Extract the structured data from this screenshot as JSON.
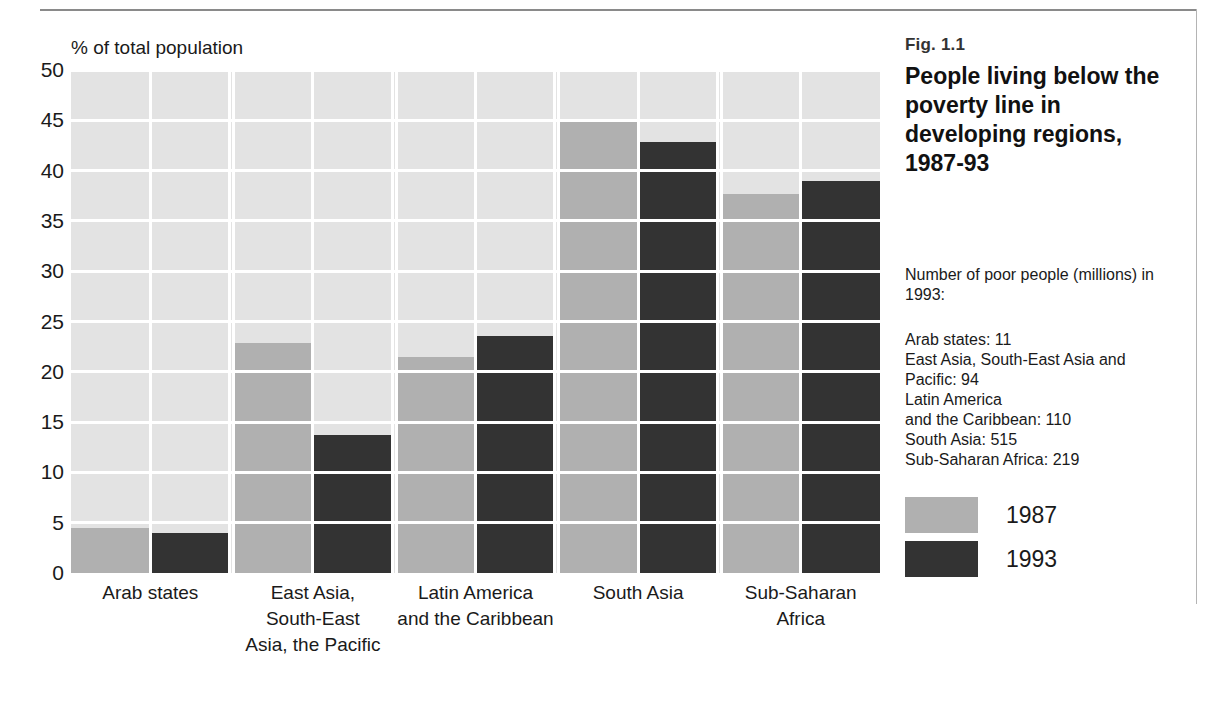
{
  "figure": {
    "number": "Fig. 1.1",
    "title": "People living below the poverty line in developing regions, 1987-93"
  },
  "side_notes": {
    "poor_heading": "Number of poor people (millions) in 1993:",
    "poor_values": "Arab states: 11\nEast Asia, South-East Asia and\nPacific: 94\nLatin America\nand the Caribbean: 110\nSouth Asia: 515\nSub-Saharan Africa: 219"
  },
  "colors": {
    "series_1987": "#b0b0b0",
    "series_1993": "#333333",
    "plot_background": "#e3e3e3",
    "gridline": "#ffffff",
    "rule": "#8a8a8a"
  },
  "chart_data": {
    "type": "bar",
    "title": "People living below the poverty line in developing regions, 1987-93",
    "subtitle": "Fig. 1.1",
    "xlabel": "",
    "ylabel": "% of total population",
    "ylim": [
      0,
      50
    ],
    "yticks": [
      0,
      5,
      10,
      15,
      20,
      25,
      30,
      35,
      40,
      45,
      50
    ],
    "ytick_labels": [
      "0",
      "5",
      "10",
      "15",
      "20",
      "25",
      "30",
      "35",
      "40",
      "45",
      "50"
    ],
    "grid": true,
    "legend_position": "right",
    "categories": [
      "Arab states",
      "East Asia,\nSouth-East\nAsia, the Pacific",
      "Latin America\nand the Caribbean",
      "South Asia",
      "Sub-Saharan\nAfrica"
    ],
    "series": [
      {
        "name": "1987",
        "color": "#b0b0b0",
        "values": [
          4.5,
          22.9,
          21.5,
          44.8,
          37.7
        ]
      },
      {
        "name": "1993",
        "color": "#333333",
        "values": [
          4.0,
          13.7,
          23.6,
          42.8,
          39.0
        ]
      }
    ],
    "annotations": [
      "Number of poor people (millions) in 1993:",
      "Arab states: 11",
      "East Asia, South-East Asia and Pacific: 94",
      "Latin America and the Caribbean: 110",
      "South Asia: 515",
      "Sub-Saharan Africa: 219"
    ]
  }
}
